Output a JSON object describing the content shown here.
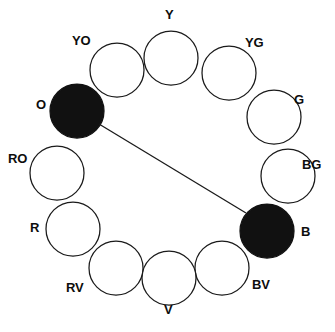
{
  "diagram": {
    "type": "color-wheel",
    "background_color": "#ffffff",
    "outline_color": "#1a1a1a",
    "open_fill_color": "#ffffff",
    "filled_fill_color": "#111111",
    "label_color": "#0d0d0d",
    "circle_radius": 27,
    "wheel_center": {
      "x": 170,
      "y": 168
    },
    "wheel_ring_radius": 118
  },
  "hues": [
    {
      "code": "Y",
      "name": "Yellow",
      "state": "open",
      "cx": 171,
      "cy": 58,
      "label_x": 165,
      "label_y": 8
    },
    {
      "code": "YG",
      "name": "Yellow-Green",
      "state": "open",
      "cx": 229,
      "cy": 73,
      "label_x": 245,
      "label_y": 36
    },
    {
      "code": "G",
      "name": "Green",
      "state": "open",
      "cx": 274,
      "cy": 117,
      "label_x": 294,
      "label_y": 93
    },
    {
      "code": "BG",
      "name": "Blue-Green",
      "state": "open",
      "cx": 288,
      "cy": 176,
      "label_x": 302,
      "label_y": 158
    },
    {
      "code": "B",
      "name": "Blue",
      "state": "filled",
      "cx": 267,
      "cy": 231,
      "label_x": 301,
      "label_y": 225
    },
    {
      "code": "BV",
      "name": "Blue-Violet",
      "state": "open",
      "cx": 222,
      "cy": 268,
      "label_x": 252,
      "label_y": 278
    },
    {
      "code": "V",
      "name": "Violet",
      "state": "open",
      "cx": 169,
      "cy": 278,
      "label_x": 164,
      "label_y": 303
    },
    {
      "code": "RV",
      "name": "Red-Violet",
      "state": "open",
      "cx": 116,
      "cy": 268,
      "label_x": 66,
      "label_y": 281
    },
    {
      "code": "R",
      "name": "Red",
      "state": "open",
      "cx": 73,
      "cy": 229,
      "label_x": 30,
      "label_y": 221
    },
    {
      "code": "RO",
      "name": "Red-Orange",
      "state": "open",
      "cx": 57,
      "cy": 173,
      "label_x": 8,
      "label_y": 152
    },
    {
      "code": "O",
      "name": "Orange",
      "state": "filled",
      "cx": 77,
      "cy": 111,
      "label_x": 36,
      "label_y": 98
    },
    {
      "code": "YO",
      "name": "Yellow-Orange",
      "state": "open",
      "cx": 117,
      "cy": 70,
      "label_x": 72,
      "label_y": 34
    }
  ],
  "connector": {
    "name": "complement-connector",
    "from_code": "O",
    "to_code": "B",
    "x1": 99,
    "y1": 124,
    "x2": 246,
    "y2": 213
  }
}
